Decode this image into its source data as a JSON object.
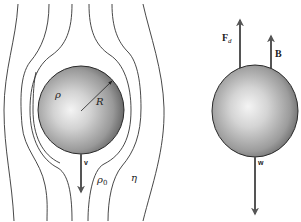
{
  "figure": {
    "colors": {
      "streamline": "#333333",
      "arrow": "#555555",
      "sphere_highlight": "#f2f2f2",
      "sphere_mid": "#b5b5b5",
      "sphere_shadow": "#5e5e5e",
      "sphere_outline": "#2a2a2a"
    }
  },
  "left_panel": {
    "sphere_density_label": "ρ",
    "radius_label": "R",
    "velocity_label": "v",
    "fluid_density_label": "ρ",
    "fluid_density_subscript": "0",
    "viscosity_label": "η"
  },
  "right_panel": {
    "drag_force_label": "F",
    "drag_force_subscript": "d",
    "buoyancy_label": "B",
    "weight_label": "w"
  }
}
